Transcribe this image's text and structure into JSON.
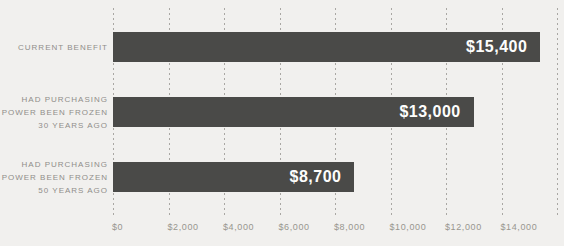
{
  "chart_data": {
    "type": "bar",
    "orientation": "horizontal",
    "title": "",
    "xlabel": "",
    "ylabel": "",
    "xlim": [
      0,
      16000
    ],
    "x_tick_interval": 2000,
    "x_ticks": [
      "$0",
      "$2,000",
      "$4,000",
      "$6,000",
      "$8,000",
      "$10,000",
      "$12,000",
      "$14,000"
    ],
    "grid": "dashed vertical gridlines from $0 to $16,000",
    "legend": "none",
    "rows": [
      {
        "category": "CURRENT BENEFIT",
        "label_lines": [
          "CURRENT BENEFIT"
        ],
        "value": 15400,
        "value_label": "$15,400"
      },
      {
        "category": "HAD PURCHASING POWER BEEN FROZEN 30 YEARS AGO",
        "label_lines": [
          "HAD PURCHASING",
          "POWER BEEN FROZEN",
          "30 YEARS AGO"
        ],
        "value": 13000,
        "value_label": "$13,000"
      },
      {
        "category": "HAD PURCHASING POWER BEEN FROZEN 50 YEARS AGO",
        "label_lines": [
          "HAD PURCHASING",
          "POWER BEEN FROZEN",
          "50 YEARS AGO"
        ],
        "value": 8700,
        "value_label": "$8,700"
      }
    ],
    "colors": {
      "bar": "#4a4a48",
      "background": "#f1f0ee",
      "gridline": "#a9a7a3",
      "category_label": "#908e8a",
      "tick_label": "#98968f",
      "value_label": "#fdfdfc"
    }
  }
}
